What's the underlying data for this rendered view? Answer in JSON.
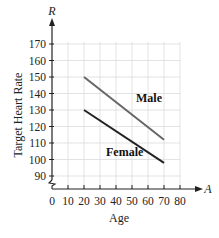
{
  "chart_data": {
    "type": "line",
    "title": "",
    "xlabel": "Age",
    "ylabel": "Target Heart Rate",
    "x_axis_variable": "A",
    "y_axis_variable": "R",
    "xlim": [
      0,
      80
    ],
    "ylim": [
      85,
      175
    ],
    "x_ticks": [
      0,
      10,
      20,
      30,
      40,
      50,
      60,
      70,
      80
    ],
    "y_ticks": [
      90,
      100,
      110,
      120,
      130,
      140,
      150,
      160,
      170
    ],
    "y_axis_break": true,
    "grid": true,
    "legend_position": "inline labels",
    "series": [
      {
        "name": "Male",
        "x": [
          20,
          70
        ],
        "values": [
          150,
          112
        ],
        "color": "#666666"
      },
      {
        "name": "Female",
        "x": [
          20,
          70
        ],
        "values": [
          130,
          98
        ],
        "color": "#222222"
      }
    ]
  },
  "labels": {
    "y_var": "R",
    "x_var": "A",
    "y_title": "Target Heart Rate",
    "x_title": "Age",
    "male": "Male",
    "female": "Female"
  }
}
